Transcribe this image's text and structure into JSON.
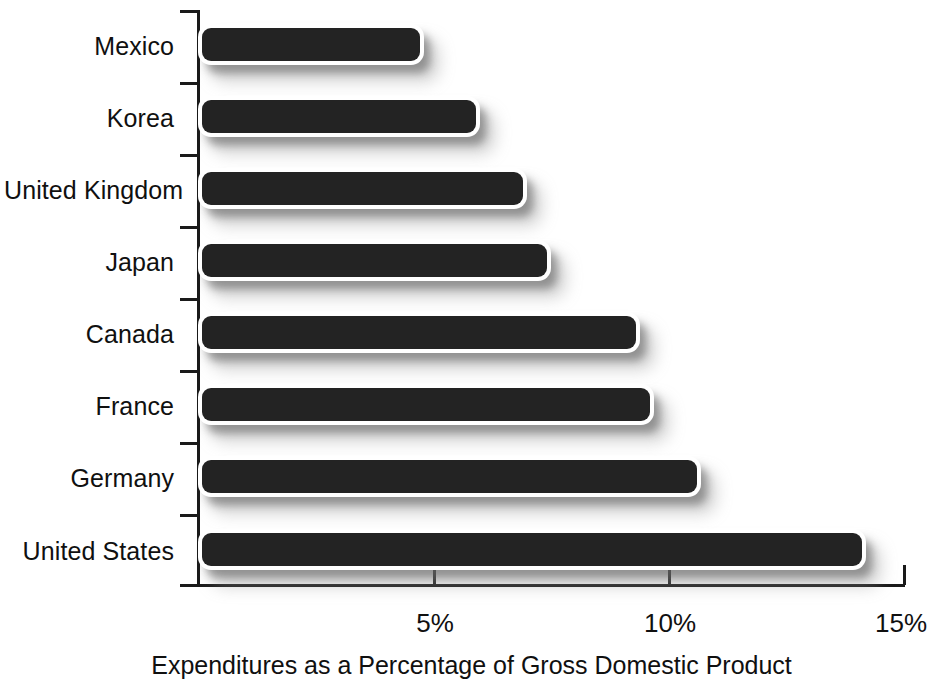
{
  "chart_data": {
    "type": "bar",
    "orientation": "horizontal",
    "title": "",
    "xlabel": "Expenditures as a Percentage of Gross Domestic Product",
    "ylabel": "",
    "categories": [
      "Mexico",
      "Korea",
      "United Kingdom",
      "Japan",
      "Canada",
      "France",
      "Germany",
      "United States"
    ],
    "values": [
      4.7,
      5.9,
      6.9,
      7.4,
      9.3,
      9.6,
      10.6,
      14.1
    ],
    "xlim": [
      0,
      15
    ],
    "xticks": [
      5,
      10,
      15
    ],
    "xtick_labels": [
      "5%",
      "10%",
      "15%"
    ],
    "grid": false,
    "legend": null,
    "bar_color": "#232323",
    "background_color": "#ffffff",
    "axis_color": "#1a1a1a"
  }
}
